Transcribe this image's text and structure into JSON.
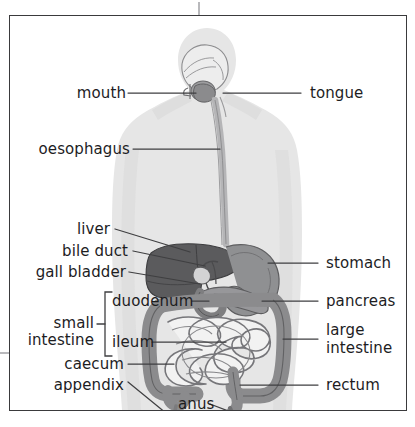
{
  "figure": {
    "style": "greyscale scanned textbook illustration with leader lines to labels"
  },
  "colors": {
    "page_background": "#ffffff",
    "frame_border": "#3a3a3c",
    "label_text": "#1d1d1f",
    "leader_line": "#3f3f41",
    "body_silhouette": "#e4e4e4",
    "body_silhouette_edge": "#d8d8d8",
    "oesophagus": "#b9b9ba",
    "liver": "#5d5d5f",
    "stomach": "#8f9092",
    "gall_bladder": "#cfcfd0",
    "pancreas": "#9a9a9c",
    "duodenum": "#8a8a8c",
    "large_intestine": "#8b8b8d",
    "small_intestine_fill": "#f2f2f2",
    "small_intestine_outline": "#7d7d7f"
  },
  "labels": {
    "left": [
      {
        "id": "mouth",
        "text": "mouth"
      },
      {
        "id": "oesophagus",
        "text": "oesophagus"
      },
      {
        "id": "liver",
        "text": "liver"
      },
      {
        "id": "bile-duct",
        "text": "bile duct"
      },
      {
        "id": "gall-bladder",
        "text": "gall bladder"
      },
      {
        "id": "duodenum",
        "text": "duodenum"
      },
      {
        "id": "ileum",
        "text": "ileum"
      },
      {
        "id": "caecum",
        "text": "caecum"
      },
      {
        "id": "appendix",
        "text": "appendix"
      }
    ],
    "right": [
      {
        "id": "tongue",
        "text": "tongue"
      },
      {
        "id": "stomach",
        "text": "stomach"
      },
      {
        "id": "pancreas",
        "text": "pancreas"
      },
      {
        "id": "large-intestine",
        "text": "large\nintestine"
      },
      {
        "id": "rectum",
        "text": "rectum"
      }
    ],
    "bottom": [
      {
        "id": "anus",
        "text": "anus"
      }
    ],
    "group": {
      "id": "small-intestine",
      "line1": "small",
      "line2": "intestine",
      "members": [
        "duodenum",
        "ileum"
      ],
      "bracket": "square bracket spanning duodenum and ileum"
    }
  }
}
